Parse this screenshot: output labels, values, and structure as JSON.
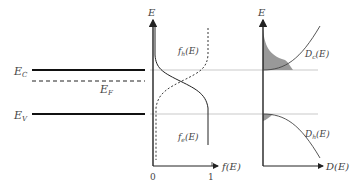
{
  "band_diagram": {
    "ec_label": "E",
    "ec_sub": "C",
    "ef_label": "E",
    "ef_sub": "F",
    "ev_label": "E",
    "ev_sub": "V"
  },
  "occupation_plot": {
    "y_axis_label": "E",
    "x_axis_label": "f(E)",
    "tick_0": "0",
    "tick_1": "1",
    "hole_curve_label": "f",
    "hole_curve_sub": "h",
    "hole_curve_arg": "(E)",
    "electron_curve_label": "f",
    "electron_curve_sub": "e",
    "electron_curve_arg": "(E)"
  },
  "dos_plot": {
    "y_axis_label": "E",
    "x_axis_label": "D(E)",
    "conduction_label": "D",
    "conduction_sub": "c",
    "conduction_arg": "(E)",
    "valence_label": "D",
    "valence_sub": "h",
    "valence_arg": "(E)"
  },
  "colors": {
    "line": "#222222",
    "guide": "#bbbbbb",
    "fill": "#999999",
    "text": "#444444"
  }
}
